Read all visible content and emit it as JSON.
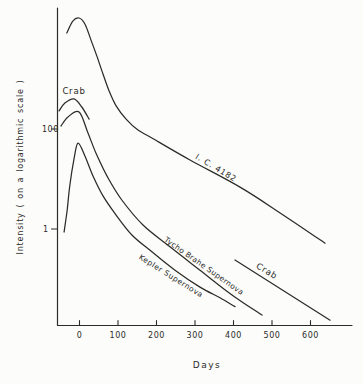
{
  "colors": {
    "ink": "#2b2b28",
    "background": "#fcfcfa"
  },
  "chart_data": {
    "type": "line",
    "title": "",
    "xlabel": "Days",
    "ylabel": "Intensity ( on a logarithmic scale )",
    "y_scale": "log",
    "grid": false,
    "x_range": [
      -55,
      705
    ],
    "x_ticks": [
      0,
      100,
      200,
      300,
      400,
      500,
      600
    ],
    "y_ticks": [
      {
        "label": "100",
        "value": 100
      },
      {
        "label": "1",
        "value": 1
      }
    ],
    "series": [
      {
        "name": "ic-4182-light-curve",
        "label": "I. C. 4182",
        "points": [
          [
            -33,
            8300
          ],
          [
            -17,
            14500
          ],
          [
            -1,
            16600
          ],
          [
            14,
            12600
          ],
          [
            30,
            6000
          ],
          [
            45,
            2900
          ],
          [
            61,
            1260
          ],
          [
            77,
            575
          ],
          [
            95,
            290
          ],
          [
            121,
            158
          ],
          [
            152,
            95
          ],
          [
            188,
            66
          ],
          [
            287,
            24
          ],
          [
            417,
            6.9
          ],
          [
            521,
            2.1
          ],
          [
            638,
            0.52
          ]
        ]
      },
      {
        "name": "crab-early-light-curve",
        "label": "Crab",
        "points": [
          [
            -53,
            230
          ],
          [
            -38,
            330
          ],
          [
            -14,
            400
          ],
          [
            6,
            275
          ],
          [
            25,
            158
          ]
        ]
      },
      {
        "name": "tycho-brahe-supernova-light-curve",
        "label": "Tycho Brahe Supernova",
        "points": [
          [
            -48,
            115
          ],
          [
            -30,
            174
          ],
          [
            -1,
            219
          ],
          [
            22,
            83
          ],
          [
            45,
            30
          ],
          [
            74,
            10.5
          ],
          [
            110,
            3.8
          ],
          [
            165,
            1.2
          ],
          [
            235,
            0.44
          ],
          [
            313,
            0.15
          ],
          [
            396,
            0.048
          ],
          [
            474,
            0.019
          ]
        ]
      },
      {
        "name": "kepler-supernova-light-curve",
        "label": "Kepler Supernova",
        "points": [
          [
            -40,
            0.87
          ],
          [
            -32,
            2.4
          ],
          [
            -25,
            7.6
          ],
          [
            -14,
            26
          ],
          [
            -4,
            52
          ],
          [
            14,
            29
          ],
          [
            35,
            11.5
          ],
          [
            61,
            4.6
          ],
          [
            95,
            1.9
          ],
          [
            136,
            0.76
          ],
          [
            188,
            0.35
          ],
          [
            248,
            0.15
          ],
          [
            313,
            0.069
          ],
          [
            365,
            0.042
          ],
          [
            404,
            0.028
          ]
        ]
      },
      {
        "name": "crab-late-decline",
        "label": "Crab",
        "points": [
          [
            404,
            0.24
          ],
          [
            651,
            0.015
          ]
        ]
      }
    ]
  }
}
